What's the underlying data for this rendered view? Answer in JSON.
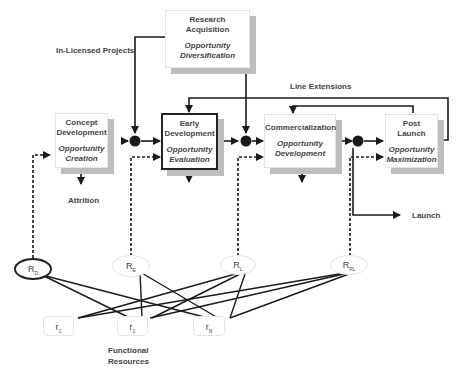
{
  "stages": {
    "research": {
      "title": "Research\nAcquisition",
      "title_l1": "Research",
      "title_l2": "Acquisition",
      "sub_l1": "Opportunity",
      "sub_l2": "Diversification"
    },
    "concept": {
      "title_l1": "Concept",
      "title_l2": "Development",
      "sub_l1": "Opportunity",
      "sub_l2": "Creation"
    },
    "early": {
      "title_l1": "Early",
      "title_l2": "Development",
      "sub_l1": "Opportunity",
      "sub_l2": "Evaluation"
    },
    "commercial": {
      "title_l1": "Commercialization",
      "sub_l1": "Opportunity",
      "sub_l2": "Development"
    },
    "post": {
      "title_l1": "Post",
      "title_l2": "Launch",
      "sub_l1": "Opportunity",
      "sub_l2": "Maximization"
    }
  },
  "labels": {
    "in_licensed": "In-Licensed Projects",
    "line_extensions": "Line Extensions",
    "attrition": "Attrition",
    "launch": "Launch",
    "functional_l1": "Functional",
    "functional_l2": "Resources"
  },
  "resource_nodes": [
    {
      "base": "R",
      "sub": "D"
    },
    {
      "base": "R",
      "sub": "E"
    },
    {
      "base": "R",
      "sub": "L"
    },
    {
      "base": "R",
      "sub": "PL"
    }
  ],
  "functional_resources": [
    {
      "base": "r",
      "sub": "1"
    },
    {
      "base": "r",
      "sub": "2"
    },
    {
      "base": "r",
      "sub": "N"
    }
  ],
  "colors": {
    "line": "#1a1a1a",
    "shadow": "#bdbdbd",
    "border": "#e4e4e4"
  }
}
